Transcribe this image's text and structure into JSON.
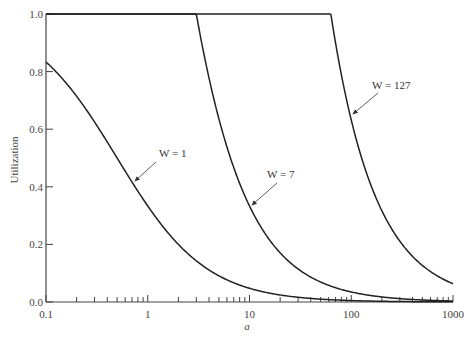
{
  "chart_data": {
    "type": "line",
    "title": "",
    "xlabel": "a",
    "ylabel": "Utilization",
    "xscale": "log",
    "xlim": [
      0.1,
      1000
    ],
    "ylim": [
      0.0,
      1.0
    ],
    "grid": false,
    "legend": "none (inline annotations with arrows)",
    "x_tick_labels": [
      "0.1",
      "1",
      "10",
      "100",
      "1000"
    ],
    "y_tick_labels": [
      "0.0",
      "0.2",
      "0.4",
      "0.6",
      "0.8",
      "1.0"
    ],
    "series": [
      {
        "name": "W = 1",
        "formula": "U = 1/(2a+1)",
        "x": [
          0.1,
          0.2,
          0.5,
          1,
          2,
          5,
          10,
          100,
          1000
        ],
        "values": [
          0.833,
          0.714,
          0.5,
          0.333,
          0.2,
          0.091,
          0.048,
          0.005,
          0.0005
        ]
      },
      {
        "name": "W = 7",
        "formula": "U = 1 for a<=3, else 7/(2a+1)",
        "x": [
          0.1,
          3,
          5,
          10,
          20,
          50,
          100,
          1000
        ],
        "values": [
          1.0,
          1.0,
          0.636,
          0.333,
          0.171,
          0.069,
          0.035,
          0.0035
        ]
      },
      {
        "name": "W = 127",
        "formula": "U = 1 for a<=63, else 127/(2a+1)",
        "x": [
          0.1,
          63,
          100,
          200,
          500,
          1000
        ],
        "values": [
          1.0,
          1.0,
          0.632,
          0.317,
          0.127,
          0.063
        ]
      }
    ],
    "annotations": [
      {
        "text": "W = 1",
        "target_x": 0.8
      },
      {
        "text": "W = 7",
        "target_x": 10
      },
      {
        "text": "W = 127",
        "target_x": 95
      }
    ]
  },
  "labels": {
    "xlabel": "a",
    "ylabel": "Utilization",
    "ann_w1": "W = 1",
    "ann_w7": "W = 7",
    "ann_w127": "W = 127",
    "x_ticks": [
      "0.1",
      "1",
      "10",
      "100",
      "1000"
    ],
    "y_ticks": [
      "0.0",
      "0.2",
      "0.4",
      "0.6",
      "0.8",
      "1.0"
    ]
  }
}
